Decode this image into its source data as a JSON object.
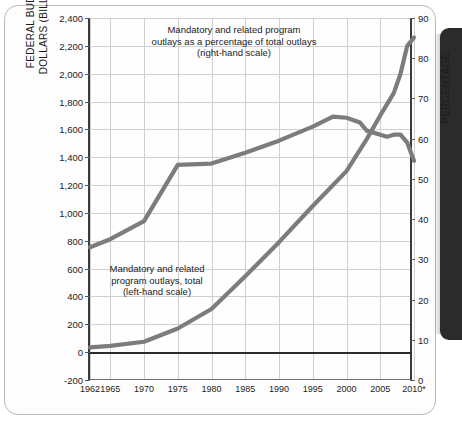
{
  "chart_data": {
    "type": "line",
    "title": "",
    "xlabel": "",
    "ylabel": "FEDERAL BUDGET DOLLARS (BILLIONS)",
    "y2label": "PERCENTAGE",
    "grid": true,
    "legend_position": "inline-annotations",
    "x": [
      1962,
      1965,
      1970,
      1975,
      1980,
      1985,
      1990,
      1995,
      2000,
      2005,
      2010
    ],
    "xlim": [
      1962,
      2010
    ],
    "ylim": [
      -200,
      2400
    ],
    "y2lim": [
      0,
      90
    ],
    "x_tick_labels": [
      "1962",
      "1965",
      "1970",
      "1975",
      "1980",
      "1985",
      "1990",
      "1995",
      "2000",
      "2005",
      "2010*"
    ],
    "y_tick_labels": [
      "2,400",
      "2,200",
      "2,000",
      "1,800",
      "1,600",
      "1,400",
      "1,200",
      "1,000",
      "800",
      "600",
      "400",
      "200",
      "0",
      "-200"
    ],
    "y_tick_values": [
      2400,
      2200,
      2000,
      1800,
      1600,
      1400,
      1200,
      1000,
      800,
      600,
      400,
      200,
      0,
      -200
    ],
    "y2_tick_labels": [
      "90",
      "80",
      "70",
      "60",
      "50",
      "40",
      "30",
      "20",
      "10",
      "0"
    ],
    "y2_tick_values": [
      90,
      80,
      70,
      60,
      50,
      40,
      30,
      20,
      10,
      0
    ],
    "series": [
      {
        "name": "Mandatory and related program outlays as a percentage of total outlays (right-hand scale)",
        "axis": "right",
        "units": "percent",
        "color": "#7c7c7c",
        "x": [
          1962,
          1965,
          1970,
          1975,
          1980,
          1985,
          1990,
          1995,
          1998,
          2000,
          2002,
          2003,
          2004,
          2005,
          2006,
          2007,
          2008,
          2009,
          2010
        ],
        "values": [
          33.0,
          35.0,
          39.5,
          53.5,
          53.8,
          56.5,
          59.5,
          63.0,
          65.5,
          65.2,
          64.0,
          62.0,
          61.5,
          61.0,
          60.5,
          61.0,
          61.0,
          59.0,
          54.5
        ]
      },
      {
        "name": "Mandatory and related program outlays, total (left-hand scale)",
        "axis": "left",
        "units": "billions of dollars",
        "color": "#7c7c7c",
        "x": [
          1962,
          1965,
          1970,
          1975,
          1980,
          1985,
          1990,
          1995,
          2000,
          2003,
          2005,
          2007,
          2008,
          2009,
          2010
        ],
        "values": [
          35,
          45,
          75,
          170,
          310,
          545,
          790,
          1050,
          1300,
          1530,
          1700,
          1860,
          2000,
          2200,
          2260
        ]
      }
    ],
    "annotations": [
      {
        "id": "annotation-percentage",
        "lines": [
          "Mandatory and related program",
          "outlays as a percentage of total outlays",
          "(right-hand scale)"
        ]
      },
      {
        "id": "annotation-dollars",
        "lines": [
          "Mandatory and related",
          "program outlays, total",
          "(left-hand scale)"
        ]
      }
    ]
  },
  "axes": {
    "left_title_line1": "FEDERAL BUDGET",
    "left_title_line2": "DOLLARS (BILLIONS)",
    "right_title": "PERCENTAGE"
  },
  "annotation_pct": {
    "line1": "Mandatory and related program",
    "line2": "outlays as a percentage of total outlays",
    "line3": "(right-hand scale)"
  },
  "annotation_dollar": {
    "line1": "Mandatory and related",
    "line2": "program outlays, total",
    "line3": "(left-hand scale)"
  }
}
